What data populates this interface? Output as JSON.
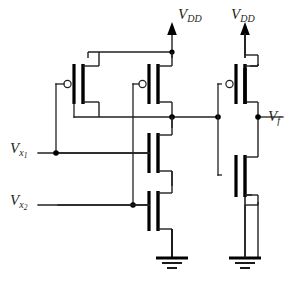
{
  "figure": {
    "kind": "cmos-transistor-schematic",
    "background_color": "#ffffff",
    "line_color": "#231f20",
    "device_color": "#000000"
  },
  "labels": {
    "vdd_left": {
      "symbol": "V",
      "subscript": "DD"
    },
    "vdd_right": {
      "symbol": "V",
      "subscript": "DD"
    },
    "vx1": {
      "symbol": "V",
      "subscript": "x",
      "subsubscript": "1"
    },
    "vx2": {
      "symbol": "V",
      "subscript": "x",
      "subsubscript": "2"
    },
    "vf": {
      "symbol": "V",
      "subscript": "f"
    }
  },
  "nets": {
    "supply_left": "VDD",
    "supply_right": "VDD",
    "input_1": "Vx1",
    "input_2": "Vx2",
    "output": "Vf",
    "internal_node": "stage1-output"
  },
  "devices": [
    {
      "id": "MP1",
      "type": "pmos",
      "stage": "gate",
      "gate_net": "Vx1",
      "note": "left pull-up, parallel"
    },
    {
      "id": "MP2",
      "type": "pmos",
      "stage": "gate",
      "gate_net": "Vx2",
      "note": "right pull-up, parallel"
    },
    {
      "id": "MN1",
      "type": "nmos",
      "stage": "gate",
      "gate_net": "Vx1",
      "note": "upper pull-down, series"
    },
    {
      "id": "MN2",
      "type": "nmos",
      "stage": "gate",
      "gate_net": "Vx2",
      "note": "lower pull-down, series"
    },
    {
      "id": "MP3",
      "type": "pmos",
      "stage": "inverter",
      "gate_net": "stage1-output",
      "note": "inverter pull-up"
    },
    {
      "id": "MN3",
      "type": "nmos",
      "stage": "inverter",
      "gate_net": "stage1-output",
      "note": "inverter pull-down"
    }
  ],
  "grounds": [
    {
      "id": "gnd-left",
      "net": "GND"
    },
    {
      "id": "gnd-right",
      "net": "GND"
    }
  ]
}
